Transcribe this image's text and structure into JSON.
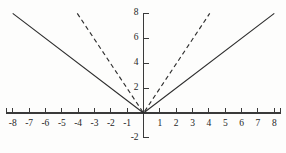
{
  "chart_data": {
    "type": "line",
    "title": "",
    "xlabel": "",
    "ylabel": "",
    "xlim": [
      -8.6,
      8.6
    ],
    "ylim": [
      -2.4,
      8.6
    ],
    "grid": false,
    "legend": "none",
    "axis": {
      "x_ticks": [
        -8,
        -7,
        -6,
        -5,
        -4,
        -3,
        -2,
        -1,
        1,
        2,
        3,
        4,
        5,
        6,
        7,
        8
      ],
      "x_tick_labels": [
        "-8",
        "-7",
        "-6",
        "-5",
        "-4",
        "-3",
        "-2",
        "-1",
        "1",
        "2",
        "3",
        "4",
        "5",
        "6",
        "7",
        "8"
      ],
      "y_ticks": [
        -2,
        2,
        4,
        6,
        8
      ],
      "y_tick_labels": [
        "-2",
        "2",
        "4",
        "6",
        "8"
      ],
      "x_axis_value": 0,
      "y_axis_value": 0,
      "x_axis_start": -8.4,
      "x_axis_end": 8.4,
      "y_axis_start": -2.0,
      "y_axis_end": 8.0,
      "x_tick_direction": "up",
      "y_tick_direction": "right",
      "axis_color": "#3a3a3a"
    },
    "series": [
      {
        "name": "y = |x|",
        "style": "solid",
        "color": "#2e2e2e",
        "x": [
          -8,
          0,
          8
        ],
        "values": [
          8,
          0,
          8
        ]
      },
      {
        "name": "y = 2|x|",
        "style": "dashed",
        "color": "#2e2e2e",
        "x": [
          -4.05,
          0,
          4.05
        ],
        "values": [
          8,
          0,
          8
        ]
      }
    ]
  }
}
